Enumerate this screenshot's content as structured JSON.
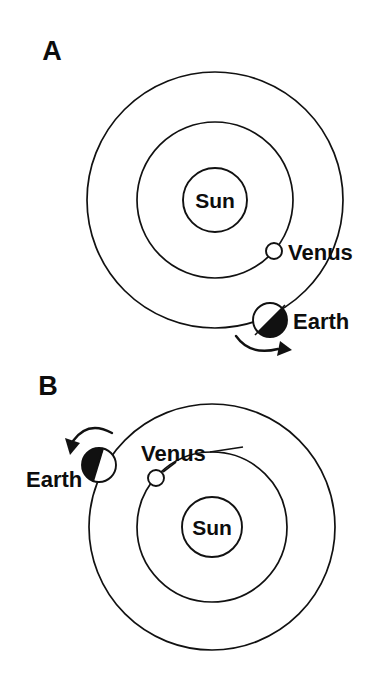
{
  "figure": {
    "background_color": "#ffffff",
    "line_color": "#111111",
    "shade_color": "#111111"
  },
  "panels": [
    {
      "letter": "A",
      "letter_x": 52,
      "letter_y": 60,
      "sun": {
        "label": "Sun",
        "cx": 215,
        "cy": 200,
        "r": 32,
        "label_x": 215,
        "label_y": 208
      },
      "orbits": [
        {
          "name": "venus-orbit",
          "cx": 215,
          "cy": 200,
          "r": 78
        },
        {
          "name": "earth-orbit",
          "cx": 215,
          "cy": 200,
          "r": 128
        }
      ],
      "venus": {
        "label": "Venus",
        "cx": 274,
        "cy": 251,
        "r": 8,
        "label_x": 288,
        "label_y": 260,
        "shaded": false
      },
      "earth": {
        "label": "Earth",
        "cx": 270,
        "cy": 320,
        "r": 17,
        "label_x": 293,
        "label_y": 329,
        "shaded": true,
        "shade_side": "lower-right"
      },
      "motion_arrow": {
        "name": "earth-orbital-direction-arrow",
        "direction": "counterclockwise",
        "path": "M 236 336 Q 250 356 278 349",
        "head": "280,341 292,350 277,356"
      }
    },
    {
      "letter": "B",
      "letter_x": 48,
      "letter_y": 395,
      "sun": {
        "label": "Sun",
        "cx": 212,
        "cy": 527,
        "r": 30,
        "label_x": 212,
        "label_y": 535
      },
      "orbits": [
        {
          "name": "venus-orbit",
          "cx": 212,
          "cy": 527,
          "r": 75
        },
        {
          "name": "earth-orbit",
          "cx": 212,
          "cy": 527,
          "r": 123
        }
      ],
      "venus": {
        "label": "Venus",
        "cx": 156,
        "cy": 478,
        "r": 8,
        "label_x": 141,
        "label_y": 461,
        "shaded": false,
        "leader": "M 163 472 L 176 462",
        "leader2": "M 210 452 L 240 447"
      },
      "earth": {
        "label": "Earth",
        "cx": 99,
        "cy": 465,
        "r": 17,
        "label_x": 26,
        "label_y": 487,
        "shaded": true,
        "shade_side": "left"
      },
      "motion_arrow": {
        "name": "earth-orbital-direction-arrow",
        "direction": "counterclockwise",
        "path": "M 112 433 Q 88 420 73 441",
        "head": "80,443 70,455 65,438"
      }
    }
  ]
}
